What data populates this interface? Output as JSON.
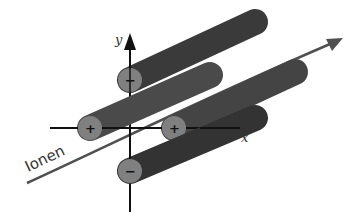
{
  "diagram": {
    "axes": {
      "x_label": "x",
      "y_label": "y",
      "origin": [
        130,
        128
      ],
      "color": "#111111"
    },
    "rods": [
      {
        "id": "top",
        "polarity": "−",
        "cap": [
          130,
          80
        ],
        "end": [
          255,
          22
        ],
        "color": "#3a3a3a"
      },
      {
        "id": "left",
        "polarity": "+",
        "cap": [
          90,
          128
        ],
        "end": [
          210,
          75
        ],
        "color": "#4a4a4a"
      },
      {
        "id": "right",
        "polarity": "+",
        "cap": [
          174,
          128
        ],
        "end": [
          295,
          72
        ],
        "color": "#444444"
      },
      {
        "id": "bottom",
        "polarity": "−",
        "cap": [
          130,
          171
        ],
        "end": [
          255,
          118
        ],
        "color": "#333333"
      }
    ],
    "cap_color": "#808080",
    "ion_beam": {
      "label": "Ionen",
      "color": "#505050"
    }
  }
}
